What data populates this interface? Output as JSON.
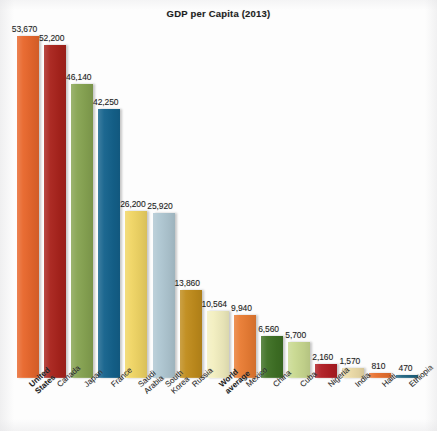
{
  "chart_data": {
    "type": "bar",
    "title": "GDP per Capita (2013)",
    "xlabel": "",
    "ylabel": "",
    "grid": false,
    "legend": "none",
    "ylim": [
      0,
      53670
    ],
    "categories": [
      "United States",
      "Canada",
      "Japan",
      "France",
      "Saudi Arabia",
      "South Korea",
      "Russia",
      "World average",
      "Mexico",
      "China",
      "Cuba",
      "Nigeria",
      "India",
      "Haiti",
      "Ethiopia"
    ],
    "values": [
      53670,
      52200,
      46140,
      42250,
      26200,
      25920,
      13860,
      10564,
      9940,
      6560,
      5700,
      2160,
      1570,
      810,
      470
    ],
    "value_labels": [
      "53,670",
      "52,200",
      "46,140",
      "42,250",
      "26,200",
      "25,920",
      "13,860",
      "10,564",
      "9,940",
      "6,560",
      "5,700",
      "2,160",
      "1,570",
      "810",
      "470"
    ],
    "bar_colors": [
      "#E8672C",
      "#A9231C",
      "#87A452",
      "#14628C",
      "#F0D564",
      "#AFC7D2",
      "#C08C1C",
      "#F3EFC0",
      "#E97C33",
      "#3E7024",
      "#C9D990",
      "#B01D23",
      "#EDDCA8",
      "#E8702E",
      "#1F6480"
    ],
    "emphasized_categories": [
      "United States",
      "World average"
    ]
  },
  "labels": {
    "0": {
      "line1": "United",
      "line2": "States"
    },
    "1": {
      "line1": "Canada",
      "line2": ""
    },
    "2": {
      "line1": "Japan",
      "line2": ""
    },
    "3": {
      "line1": "France",
      "line2": ""
    },
    "4": {
      "line1": "Saudi",
      "line2": "Arabia"
    },
    "5": {
      "line1": "South",
      "line2": "Korea"
    },
    "6": {
      "line1": "Russia",
      "line2": ""
    },
    "7": {
      "line1": "World",
      "line2": "average"
    },
    "8": {
      "line1": "Mexico",
      "line2": ""
    },
    "9": {
      "line1": "China",
      "line2": ""
    },
    "10": {
      "line1": "Cuba",
      "line2": ""
    },
    "11": {
      "line1": "Nigeria",
      "line2": ""
    },
    "12": {
      "line1": "India",
      "line2": ""
    },
    "13": {
      "line1": "Haiti",
      "line2": ""
    },
    "14": {
      "line1": "Ethiopia",
      "line2": ""
    }
  }
}
